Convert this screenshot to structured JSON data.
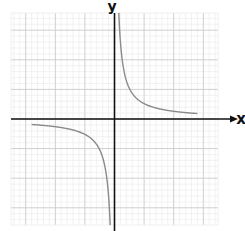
{
  "chart_data": {
    "type": "line",
    "title": "",
    "xlabel": "x",
    "ylabel": "y",
    "function": "y = k/x (reciprocal / hyperbola)",
    "k": 0.52,
    "grid": true,
    "grid_major_units": 1,
    "grid_minor_subdivisions": 5,
    "xlim": [
      -3.5,
      3.5
    ],
    "ylim": [
      -3.6,
      3.6
    ],
    "tick_labels": [],
    "series": [
      {
        "name": "branch-quadrant-I",
        "x": [
          0.14,
          0.2,
          0.3,
          0.5,
          0.75,
          1.0,
          1.5,
          2.0,
          2.8
        ],
        "y": [
          3.6,
          2.6,
          1.73,
          1.04,
          0.69,
          0.52,
          0.35,
          0.26,
          0.19
        ]
      },
      {
        "name": "branch-quadrant-III",
        "x": [
          -2.8,
          -2.0,
          -1.5,
          -1.0,
          -0.75,
          -0.5,
          -0.3,
          -0.2,
          -0.14
        ],
        "y": [
          -0.19,
          -0.26,
          -0.35,
          -0.52,
          -0.69,
          -1.04,
          -1.73,
          -2.6,
          -3.6
        ]
      }
    ],
    "colors": {
      "curve": "#8a8a8a",
      "axes": "#111111",
      "grid_major": "#cfcfcf",
      "grid_minor": "#ececec"
    },
    "legend": null
  },
  "labels": {
    "x_axis": "x",
    "y_axis": "y"
  }
}
